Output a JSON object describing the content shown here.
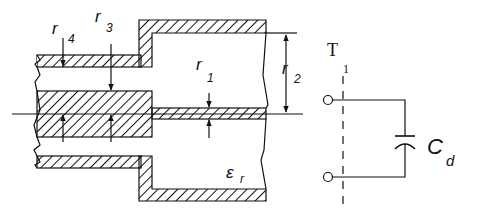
{
  "diagram": {
    "type": "coaxial-line-discontinuity-with-equivalent-circuit",
    "colors": {
      "line": "#111111",
      "background": "#ffffff",
      "hatch": "#111111"
    },
    "labels": {
      "r4": {
        "main": "r",
        "sub": "4"
      },
      "r3": {
        "main": "r",
        "sub": "3"
      },
      "r1": {
        "main": "r",
        "sub": "1"
      },
      "r2": {
        "main": "r",
        "sub": "2"
      },
      "epsilon": {
        "main": "ε",
        "sub": "r"
      },
      "terminal": {
        "main": "T",
        "sub": "1"
      },
      "capacitor": {
        "main": "C",
        "sub": "d"
      }
    },
    "components": [
      "small-coax-outer-conductor",
      "small-coax-inner-conductor",
      "large-coax-outer-conductor",
      "large-coax-inner-conductor",
      "reference-plane-T1",
      "shunt-capacitor-Cd"
    ]
  }
}
